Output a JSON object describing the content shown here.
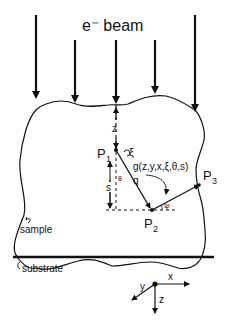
{
  "title": "e⁻ beam",
  "labels": {
    "z_top": "z",
    "p1": "P",
    "p1_sub": "1",
    "xi": "ξ",
    "s": "s",
    "theta": "θ",
    "q": "q",
    "g_func": "g(z,y,x,ξ,θ,s)",
    "p2": "P",
    "p2_sub": "2",
    "p3": "P",
    "p3_sub": "3",
    "psi": "ψ",
    "sample": "sample",
    "substrate": "substrate",
    "axis_x": "x",
    "axis_y": "y",
    "axis_z": "z"
  },
  "colors": {
    "ink": "#111111",
    "background": "#ffffff"
  }
}
